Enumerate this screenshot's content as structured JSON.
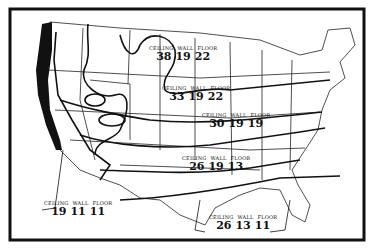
{
  "map": {
    "subject": "United States insulation recommendation zones",
    "column_headers": [
      "CEILING",
      "WALL",
      "FLOOR"
    ],
    "zones": [
      {
        "id": "north",
        "ceiling": "38",
        "wall": "19",
        "floor": "22"
      },
      {
        "id": "north-central",
        "ceiling": "33",
        "wall": "19",
        "floor": "22"
      },
      {
        "id": "central",
        "ceiling": "30",
        "wall": "19",
        "floor": "19"
      },
      {
        "id": "south-central",
        "ceiling": "26",
        "wall": "19",
        "floor": "13"
      },
      {
        "id": "west-coast",
        "ceiling": "19",
        "wall": "11",
        "floor": "11"
      },
      {
        "id": "gulf",
        "ceiling": "26",
        "wall": "13",
        "floor": "11"
      }
    ]
  },
  "colors": {
    "ink": "#111111",
    "paper": "#ffffff"
  }
}
